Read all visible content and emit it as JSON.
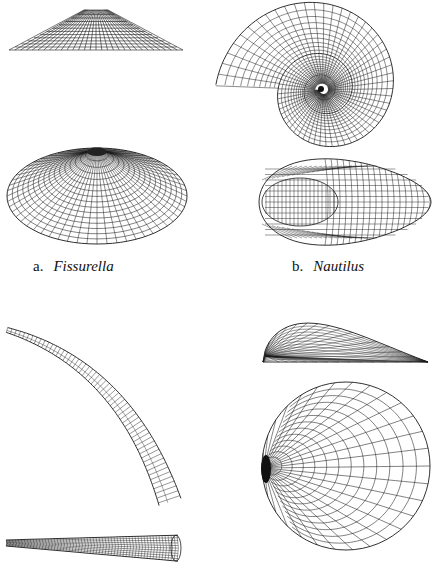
{
  "figure": {
    "panels": [
      {
        "id": "a",
        "letter": "a.",
        "name": "Fissurella",
        "views": [
          "side-view-cone",
          "oblique-view-cone"
        ],
        "label_pos": [
          33,
          258
        ]
      },
      {
        "id": "b",
        "letter": "b.",
        "name": "Nautilus",
        "views": [
          "lateral-view-spiral",
          "apertural-view"
        ],
        "label_pos": [
          292,
          258
        ]
      },
      {
        "id": "c",
        "letter": "",
        "name": "",
        "views": [
          "curved-tusk-side-view",
          "tusk-tube-view"
        ]
      },
      {
        "id": "d",
        "letter": "",
        "name": "",
        "views": [
          "valve-side-view",
          "valve-top-view"
        ]
      }
    ],
    "colors": {
      "line": "#1a1a1a",
      "background": "#ffffff",
      "text": "#111111"
    }
  }
}
